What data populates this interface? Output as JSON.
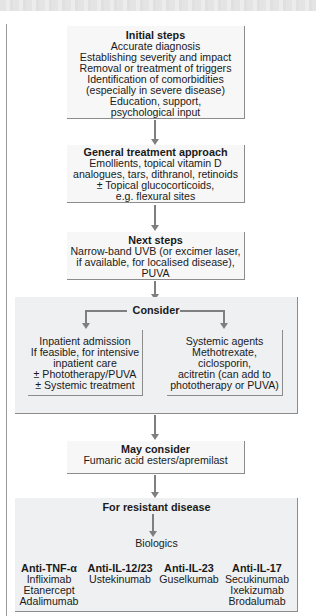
{
  "flowchart": {
    "initial_steps": {
      "title": "Initial steps",
      "lines": [
        "Accurate diagnosis",
        "Establishing severity and impact",
        "Removal or treatment of triggers",
        "Identification of comorbidities",
        "(especially in severe disease)",
        "Education, support,",
        "psychological input"
      ]
    },
    "general_treatment": {
      "title": "General treatment approach",
      "lines": [
        "Emollients, topical vitamin D",
        "analogues, tars, dithranol, retinoids",
        "± Topical glucocorticoids,",
        "e.g. flexural sites"
      ]
    },
    "next_steps": {
      "title": "Next steps",
      "lines": [
        "Narrow-band UVB (or excimer laser,",
        "if available, for localised disease),",
        "PUVA"
      ]
    },
    "consider": {
      "title": "Consider",
      "left": {
        "lines": [
          "Inpatient admission",
          "If feasible, for intensive",
          "inpatient care",
          "± Phototherapy/PUVA",
          "± Systemic treatment"
        ]
      },
      "right": {
        "lines": [
          "Systemic agents",
          "Methotrexate,",
          "ciclosporin,",
          "acitretin (can add to",
          "phototherapy or PUVA)"
        ]
      }
    },
    "may_consider": {
      "title": "May consider",
      "lines": [
        "Fumaric acid esters/apremilast"
      ]
    },
    "resistant": {
      "title": "For resistant disease",
      "biologics_label": "Biologics",
      "classes": [
        {
          "name": "Anti-TNF-α",
          "drugs": [
            "Infliximab",
            "Etanercept",
            "Adalimumab"
          ]
        },
        {
          "name": "Anti-IL-12/23",
          "drugs": [
            "Ustekinumab"
          ]
        },
        {
          "name": "Anti-IL-23",
          "drugs": [
            "Guselkumab"
          ]
        },
        {
          "name": "Anti-IL-17",
          "drugs": [
            "Secukinumab",
            "Ixekizumab",
            "Brodalumab"
          ]
        }
      ]
    }
  },
  "colors": {
    "box_fill": "#f7f7f7",
    "region_fill": "#eef0f2",
    "border": "#8c8c8c",
    "arrow": "#7f7f7f"
  }
}
